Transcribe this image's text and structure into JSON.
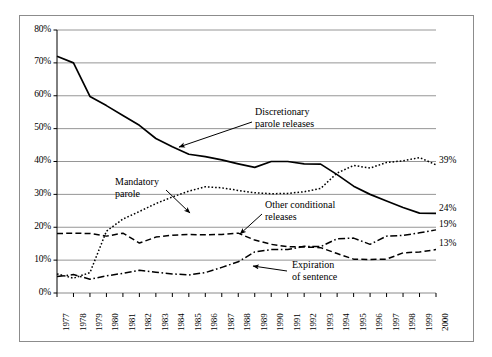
{
  "chart_data": {
    "type": "line",
    "title": "",
    "subtitle": "",
    "xlabel": "",
    "ylabel": "",
    "grid": true,
    "legend_position": "inline-annotations",
    "xlim": [
      1977,
      2000
    ],
    "ylim": [
      0,
      80
    ],
    "ytick_values": [
      0,
      10,
      20,
      30,
      40,
      50,
      60,
      70,
      80
    ],
    "ytick_labels": [
      "0%",
      "10%",
      "20%",
      "30%",
      "40%",
      "50%",
      "60%",
      "70%",
      "80%"
    ],
    "categories": [
      "1977",
      "1978",
      "1979",
      "1980",
      "1981",
      "1982",
      "1983",
      "1984",
      "1985",
      "1986",
      "1987",
      "1988",
      "1989",
      "1990",
      "1991",
      "1992",
      "1993",
      "1994",
      "1995",
      "1996",
      "1997",
      "1998",
      "1999",
      "2000"
    ],
    "series": [
      {
        "name": "Discretionary parole releases",
        "style": "solid",
        "color": "#000000",
        "end_label": "24%",
        "values": [
          72,
          70,
          59.8,
          57,
          54,
          51,
          47,
          44.5,
          42.2,
          41.5,
          40.5,
          39.3,
          38.2,
          40,
          40,
          39.3,
          39.2,
          36,
          32.5,
          30,
          28,
          26,
          24.3,
          24.2
        ]
      },
      {
        "name": "Mandatory parole",
        "style": "dotted",
        "color": "#000000",
        "end_label": "39%",
        "values": [
          5.8,
          4.5,
          6.2,
          18.8,
          22.5,
          24.8,
          27.2,
          29.2,
          31,
          32.3,
          32,
          31.2,
          30.5,
          30.2,
          30.3,
          30.8,
          31.8,
          36.5,
          38.8,
          38,
          39.7,
          40.2,
          41.2,
          39
        ]
      },
      {
        "name": "Other conditional releases",
        "style": "dashed",
        "color": "#000000",
        "end_label": "13%",
        "values": [
          18.1,
          18.2,
          18.1,
          17.3,
          18.2,
          15.2,
          17,
          17.6,
          17.8,
          17.7,
          17.8,
          18.2,
          16.1,
          14.8,
          14.1,
          14,
          13.8,
          12,
          10.3,
          10.2,
          10.3,
          12.2,
          12.5,
          13.2
        ]
      },
      {
        "name": "Expiration of sentence",
        "style": "dash-dot",
        "color": "#000000",
        "end_label": "19%",
        "values": [
          5,
          5.6,
          4.2,
          5.2,
          6,
          6.9,
          6.3,
          5.8,
          5.5,
          6.2,
          7.8,
          9.5,
          12.5,
          13.2,
          13.2,
          14.2,
          14.1,
          16.5,
          16.7,
          14.8,
          17.3,
          17.5,
          18.3,
          19.2
        ]
      }
    ],
    "annotations": [
      {
        "id": "discretionary",
        "text_lines": [
          "Discretionary",
          "parole releases"
        ],
        "arrow_from": [
          252,
          122
        ],
        "arrow_to": [
          179,
          147
        ]
      },
      {
        "id": "mandatory",
        "text_lines": [
          "Mandatory",
          "parole"
        ],
        "arrow_from": [
          166,
          190
        ],
        "arrow_to": [
          190,
          213
        ]
      },
      {
        "id": "other-conditional",
        "text_lines": [
          "Other conditional",
          "releases"
        ],
        "arrow_from": [
          262,
          214
        ],
        "arrow_to": [
          240,
          234
        ]
      },
      {
        "id": "expiration",
        "text_lines": [
          "Expiration",
          "of sentence"
        ],
        "arrow_from": [
          287,
          271
        ],
        "arrow_to": [
          253,
          266
        ]
      }
    ],
    "end_labels": [
      {
        "text": "39%",
        "value": 39
      },
      {
        "text": "24%",
        "value": 24
      },
      {
        "text": "19%",
        "value": 19
      },
      {
        "text": "13%",
        "value": 13
      }
    ]
  }
}
